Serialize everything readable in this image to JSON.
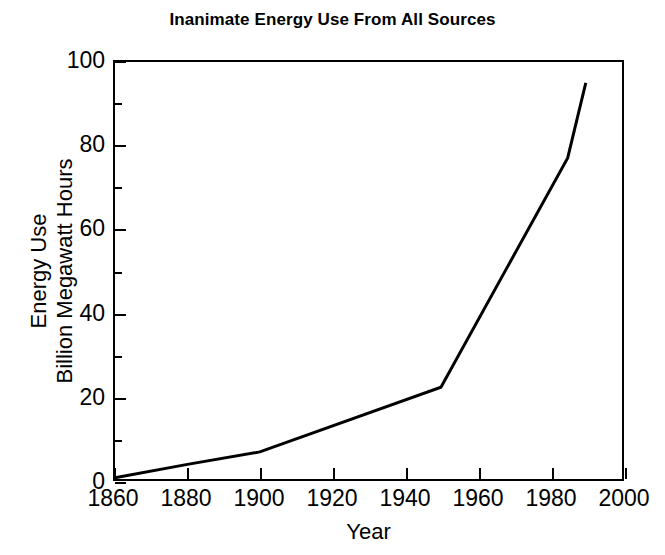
{
  "chart_data": {
    "type": "line",
    "title": "Inanimate Energy Use From All Sources",
    "xlabel": "Year",
    "ylabel": "Energy Use Billion Megawatt Hours",
    "ylabel_line1": "Energy Use",
    "ylabel_line2": "Billion Megawatt Hours",
    "xlim": [
      1860,
      2000
    ],
    "ylim": [
      0,
      100
    ],
    "xticks": [
      1860,
      1880,
      1900,
      1920,
      1940,
      1960,
      1980,
      2000
    ],
    "xtick_labels": [
      "1860",
      "1880",
      "1900",
      "1920",
      "1940",
      "1960",
      "1980",
      "2000"
    ],
    "yticks": [
      0,
      20,
      40,
      60,
      80,
      100
    ],
    "ytick_labels": [
      "0",
      "20",
      "40",
      "60",
      "80",
      "100"
    ],
    "y_minor_ticks": [
      10,
      30,
      50,
      70,
      90
    ],
    "grid": false,
    "legend": "none",
    "line_color": "#000000",
    "line_width": 3,
    "series": [
      {
        "name": "Inanimate energy use",
        "x": [
          1860,
          1880,
          1900,
          1950,
          1985,
          1990
        ],
        "values": [
          0.3,
          3.5,
          6.5,
          22.0,
          77.0,
          95.0
        ]
      }
    ]
  }
}
